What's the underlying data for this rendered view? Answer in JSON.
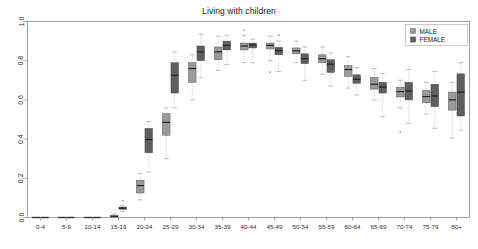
{
  "chart_data": {
    "type": "box",
    "title": "Living with children",
    "xlabel": "",
    "ylabel": "",
    "ylim": [
      0.0,
      1.0
    ],
    "yticks": [
      0.0,
      0.2,
      0.4,
      0.6,
      0.8,
      1.0
    ],
    "ytick_labels": [
      "0.0",
      "0.2",
      "0.4",
      "0.6",
      "0.8",
      "1.0"
    ],
    "grid": false,
    "legend_position": "top-right",
    "categories": [
      "0-4",
      "5-9",
      "10-14",
      "15-19",
      "20-24",
      "25-29",
      "30-34",
      "35-39",
      "40-44",
      "45-49",
      "50-54",
      "55-59",
      "60-64",
      "65-69",
      "70-74",
      "75-79",
      "80+"
    ],
    "series": [
      {
        "name": "MALE",
        "color": "#9a9a9a",
        "boxes": [
          {
            "category": "0-4",
            "whisker_low": 0.0,
            "q1": 0.0,
            "median": 0.0,
            "q3": 0.0,
            "whisker_high": 0.0,
            "outliers": []
          },
          {
            "category": "5-9",
            "whisker_low": 0.0,
            "q1": 0.0,
            "median": 0.0,
            "q3": 0.0,
            "whisker_high": 0.0,
            "outliers": []
          },
          {
            "category": "10-14",
            "whisker_low": 0.0,
            "q1": 0.0,
            "median": 0.0,
            "q3": 0.0,
            "whisker_high": 0.0,
            "outliers": []
          },
          {
            "category": "15-19",
            "whisker_low": 0.0,
            "q1": 0.003,
            "median": 0.006,
            "q3": 0.01,
            "whisker_high": 0.017,
            "outliers": []
          },
          {
            "category": "20-24",
            "whisker_low": 0.09,
            "q1": 0.125,
            "median": 0.163,
            "q3": 0.19,
            "whisker_high": 0.225,
            "outliers": []
          },
          {
            "category": "25-29",
            "whisker_low": 0.3,
            "q1": 0.42,
            "median": 0.485,
            "q3": 0.53,
            "whisker_high": 0.56,
            "outliers": []
          },
          {
            "category": "30-34",
            "whisker_low": 0.6,
            "q1": 0.69,
            "median": 0.76,
            "q3": 0.79,
            "whisker_high": 0.83,
            "outliers": []
          },
          {
            "category": "35-39",
            "whisker_low": 0.75,
            "q1": 0.805,
            "median": 0.845,
            "q3": 0.87,
            "whisker_high": 0.925,
            "outliers": []
          },
          {
            "category": "40-44",
            "whisker_low": 0.79,
            "q1": 0.855,
            "median": 0.875,
            "q3": 0.89,
            "whisker_high": 0.93,
            "outliers": [
              0.955
            ]
          },
          {
            "category": "45-49",
            "whisker_low": 0.8,
            "q1": 0.86,
            "median": 0.878,
            "q3": 0.89,
            "whisker_high": 0.925,
            "outliers": [
              0.742
            ]
          },
          {
            "category": "50-54",
            "whisker_low": 0.79,
            "q1": 0.835,
            "median": 0.85,
            "q3": 0.865,
            "whisker_high": 0.9,
            "outliers": []
          },
          {
            "category": "55-59",
            "whisker_low": 0.73,
            "q1": 0.79,
            "median": 0.81,
            "q3": 0.83,
            "whisker_high": 0.87,
            "outliers": []
          },
          {
            "category": "60-64",
            "whisker_low": 0.66,
            "q1": 0.72,
            "median": 0.755,
            "q3": 0.775,
            "whisker_high": 0.82,
            "outliers": []
          },
          {
            "category": "65-69",
            "whisker_low": 0.6,
            "q1": 0.655,
            "median": 0.68,
            "q3": 0.715,
            "whisker_high": 0.76,
            "outliers": []
          },
          {
            "category": "70-74",
            "whisker_low": 0.56,
            "q1": 0.615,
            "median": 0.642,
            "q3": 0.665,
            "whisker_high": 0.7,
            "outliers": [
              0.437
            ]
          },
          {
            "category": "75-79",
            "whisker_low": 0.527,
            "q1": 0.585,
            "median": 0.617,
            "q3": 0.648,
            "whisker_high": 0.69,
            "outliers": []
          },
          {
            "category": "80+",
            "whisker_low": 0.405,
            "q1": 0.548,
            "median": 0.6,
            "q3": 0.64,
            "whisker_high": 0.69,
            "outliers": []
          }
        ]
      },
      {
        "name": "FEMALE",
        "color": "#5e5e5e",
        "boxes": [
          {
            "category": "0-4",
            "whisker_low": 0.0,
            "q1": 0.0,
            "median": 0.0,
            "q3": 0.0,
            "whisker_high": 0.0,
            "outliers": []
          },
          {
            "category": "5-9",
            "whisker_low": 0.0,
            "q1": 0.0,
            "median": 0.0,
            "q3": 0.0,
            "whisker_high": 0.0,
            "outliers": []
          },
          {
            "category": "10-14",
            "whisker_low": 0.0,
            "q1": 0.0,
            "median": 0.0,
            "q3": 0.0,
            "whisker_high": 0.0,
            "outliers": []
          },
          {
            "category": "15-19",
            "whisker_low": 0.03,
            "q1": 0.042,
            "median": 0.048,
            "q3": 0.053,
            "whisker_high": 0.06,
            "outliers": [
              0.085
            ]
          },
          {
            "category": "20-24",
            "whisker_low": 0.232,
            "q1": 0.33,
            "median": 0.398,
            "q3": 0.455,
            "whisker_high": 0.49,
            "outliers": []
          },
          {
            "category": "25-29",
            "whisker_low": 0.56,
            "q1": 0.635,
            "median": 0.725,
            "q3": 0.79,
            "whisker_high": 0.845,
            "outliers": []
          },
          {
            "category": "30-34",
            "whisker_low": 0.715,
            "q1": 0.8,
            "median": 0.845,
            "q3": 0.875,
            "whisker_high": 0.935,
            "outliers": []
          },
          {
            "category": "35-39",
            "whisker_low": 0.78,
            "q1": 0.855,
            "median": 0.878,
            "q3": 0.9,
            "whisker_high": 0.93,
            "outliers": []
          },
          {
            "category": "40-44",
            "whisker_low": 0.79,
            "q1": 0.865,
            "median": 0.88,
            "q3": 0.89,
            "whisker_high": 0.91,
            "outliers": []
          },
          {
            "category": "45-49",
            "whisker_low": 0.745,
            "q1": 0.83,
            "median": 0.852,
            "q3": 0.868,
            "whisker_high": 0.9,
            "outliers": [
              0.93
            ]
          },
          {
            "category": "50-54",
            "whisker_low": 0.7,
            "q1": 0.785,
            "median": 0.81,
            "q3": 0.835,
            "whisker_high": 0.87,
            "outliers": []
          },
          {
            "category": "55-59",
            "whisker_low": 0.67,
            "q1": 0.74,
            "median": 0.782,
            "q3": 0.805,
            "whisker_high": 0.84,
            "outliers": []
          },
          {
            "category": "60-64",
            "whisker_low": 0.625,
            "q1": 0.685,
            "median": 0.705,
            "q3": 0.728,
            "whisker_high": 0.765,
            "outliers": []
          },
          {
            "category": "65-69",
            "whisker_low": 0.515,
            "q1": 0.635,
            "median": 0.665,
            "q3": 0.69,
            "whisker_high": 0.735,
            "outliers": []
          },
          {
            "category": "70-74",
            "whisker_low": 0.48,
            "q1": 0.6,
            "median": 0.645,
            "q3": 0.69,
            "whisker_high": 0.755,
            "outliers": []
          },
          {
            "category": "75-79",
            "whisker_low": 0.455,
            "q1": 0.565,
            "median": 0.62,
            "q3": 0.68,
            "whisker_high": 0.745,
            "outliers": []
          },
          {
            "category": "80+",
            "whisker_low": 0.445,
            "q1": 0.518,
            "median": 0.64,
            "q3": 0.733,
            "whisker_high": 0.79,
            "outliers": []
          }
        ]
      }
    ],
    "legend": [
      {
        "label": "MALE",
        "color": "#9a9a9a"
      },
      {
        "label": "FEMALE",
        "color": "#5e5e5e"
      }
    ]
  },
  "colors": {
    "male": "#9a9a9a",
    "female": "#5e5e5e",
    "axis": "#8a8a8a",
    "text": "#1a1a1a",
    "background": "#ffffff",
    "legend_border": "#b4b4b4"
  }
}
